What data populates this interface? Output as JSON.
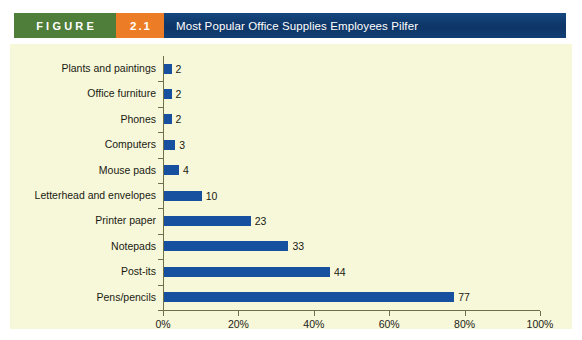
{
  "figure": {
    "word_label": "FIGURE",
    "number_label": "2.1",
    "title": "Most Popular Office Supplies Employees Pilfer",
    "colors": {
      "figure_word_bg": "#4f7d3a",
      "figure_number_bg": "#ec7d26",
      "title_bg": "#0e3566",
      "panel_bg": "#f7f8da",
      "bar": "#16509e",
      "axis": "#6f6f4a",
      "text": "#1a1a12"
    }
  },
  "chart_data": {
    "type": "bar",
    "orientation": "horizontal",
    "title": "Most Popular Office Supplies Employees Pilfer",
    "xlabel": "",
    "ylabel": "",
    "xlim": [
      0,
      100
    ],
    "grid": false,
    "legend": null,
    "x_tick_labels": [
      "0%",
      "20%",
      "40%",
      "60%",
      "80%",
      "100%"
    ],
    "x_tick_values": [
      0,
      20,
      40,
      60,
      80,
      100
    ],
    "categories": [
      "Plants and paintings",
      "Office furniture",
      "Phones",
      "Computers",
      "Mouse pads",
      "Letterhead and envelopes",
      "Printer paper",
      "Notepads",
      "Post-its",
      "Pens/pencils"
    ],
    "values": [
      2,
      2,
      2,
      3,
      4,
      10,
      23,
      33,
      44,
      77
    ],
    "value_labels": [
      "2",
      "2",
      "2",
      "3",
      "4",
      "10",
      "23",
      "33",
      "44",
      "77"
    ]
  }
}
